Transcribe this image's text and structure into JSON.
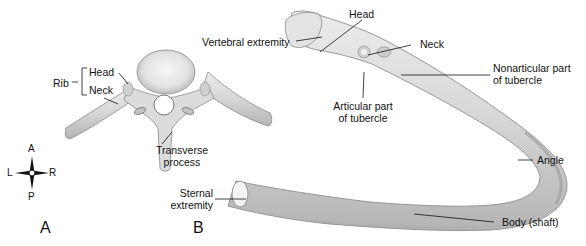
{
  "panel_a": {
    "letter": "A",
    "labels": {
      "rib": "Rib",
      "head": "Head",
      "neck": "Neck",
      "transverse_process_1": "Transverse",
      "transverse_process_2": "process"
    },
    "compass": {
      "anterior": "A",
      "posterior": "P",
      "left": "L",
      "right": "R"
    }
  },
  "panel_b": {
    "letter": "B",
    "labels": {
      "head": "Head",
      "vertebral_extremity": "Vertebral extremity",
      "neck": "Neck",
      "nonarticular_1": "Nonarticular part",
      "nonarticular_2": "of tubercle",
      "articular_1": "Articular part",
      "articular_2": "of tubercle",
      "angle": "Angle",
      "sternal_1": "Sternal",
      "sternal_2": "extremity",
      "body": "Body (shaft)"
    }
  },
  "colors": {
    "bone_fill": "#d9d9d9",
    "bone_shadow": "#a8a8a8",
    "bone_highlight": "#f2f2f2",
    "leader_line": "#111111"
  }
}
